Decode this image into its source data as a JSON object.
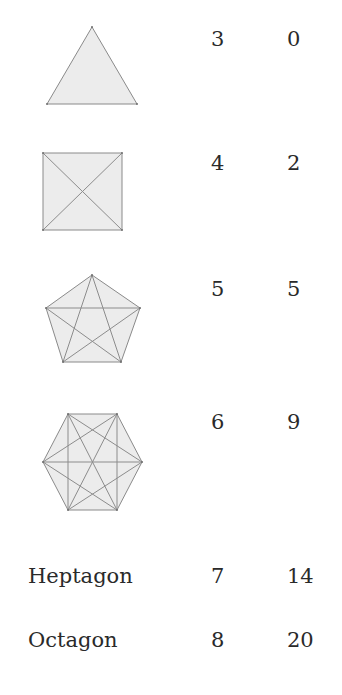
{
  "table": {
    "rows": [
      {
        "shape": "triangle-icon",
        "name": "",
        "sides": "3",
        "diagonals": "0"
      },
      {
        "shape": "square-icon",
        "name": "",
        "sides": "4",
        "diagonals": "2"
      },
      {
        "shape": "pentagon-icon",
        "name": "",
        "sides": "5",
        "diagonals": "5"
      },
      {
        "shape": "hexagon-icon",
        "name": "",
        "sides": "6",
        "diagonals": "9"
      },
      {
        "shape": "",
        "name": "Heptagon",
        "sides": "7",
        "diagonals": "14"
      },
      {
        "shape": "",
        "name": "Octagon",
        "sides": "8",
        "diagonals": "20"
      }
    ]
  },
  "colors": {
    "shape_fill": "#ececec",
    "shape_stroke": "#8a8a8a",
    "text": "#2a2a2a"
  }
}
